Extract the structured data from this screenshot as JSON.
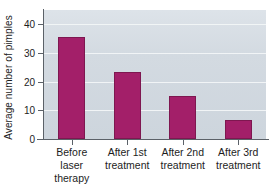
{
  "chart_data": {
    "type": "bar",
    "title": "",
    "subtitle": "",
    "xlabel": "",
    "ylabel": "Average number of pimples",
    "categories": [
      "Before laser\ntherapy",
      "After 1st\ntreatment",
      "After 2nd\ntreatment",
      "After 3rd\ntreatment"
    ],
    "values": [
      35.5,
      23.5,
      15,
      6.5
    ],
    "ylim": [
      0,
      45
    ],
    "yticks": [
      0,
      10,
      20,
      30,
      40
    ],
    "ytick_labels": [
      "0",
      "10",
      "20",
      "30",
      "40"
    ],
    "grid": true,
    "grid_axis": "y",
    "legend": false,
    "legend_position": "none",
    "colors": {
      "bar_fill": "#a31f69",
      "bar_edge": "#7e1750",
      "plot_background": "#d3dae1",
      "gridline": "#f2f5f7",
      "axis": "#5b6168",
      "text": "#1d1d1d",
      "figure_background": "#ffffff"
    }
  }
}
